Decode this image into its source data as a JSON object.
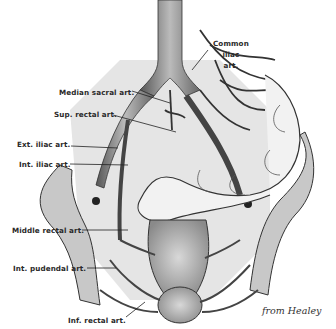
{
  "figure": {
    "credit": "from Healey",
    "labels": {
      "common_iliac": [
        "Common",
        "iliac",
        "art."
      ],
      "median_sacral": "Median sacral art.",
      "sup_rectal": "Sup. rectal art.",
      "ext_iliac": "Ext. iliac art.",
      "int_iliac": "Int. iliac art.",
      "middle_rectal": "Middle rectal art.",
      "int_pudendal": "Int. pudendal art.",
      "inf_rectal": "Inf. rectal art."
    },
    "colors": {
      "ink": "#2a2a2a",
      "vessel_shade": "#8a8a8a",
      "bone": "#c8c8c8",
      "tissue": "#b0b0b0",
      "paper": "#ffffff"
    }
  }
}
